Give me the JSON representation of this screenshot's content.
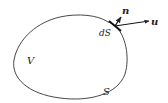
{
  "diagram": {
    "type": "control-volume",
    "colors": {
      "stroke": "#333333",
      "text": "#222222",
      "background": "#ffffff"
    },
    "labels": {
      "region": "V",
      "boundary": "S",
      "surface_element": "dS",
      "normal_vector": "n",
      "velocity_vector": "u"
    }
  }
}
